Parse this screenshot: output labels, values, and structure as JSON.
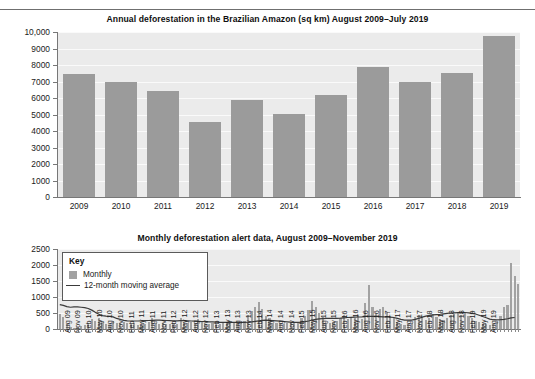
{
  "page": {
    "background": "#ffffff",
    "bar_color": "#9b9b9b",
    "plot_background": "#ebebeb",
    "line_color": "#3a3a3a"
  },
  "chart_data": [
    {
      "id": "annual",
      "type": "bar",
      "title": "Annual deforestation in the Brazilian Amazon (sq km) August 2009–July 2019",
      "xlabel": "",
      "ylabel": "",
      "ylim": [
        0,
        10000
      ],
      "ytick_labels": [
        "0",
        "1000",
        "2000",
        "3000",
        "4000",
        "5000",
        "6000",
        "7000",
        "8000",
        "9000",
        "10,000"
      ],
      "yticks": [
        0,
        1000,
        2000,
        3000,
        4000,
        5000,
        6000,
        7000,
        8000,
        9000,
        10000
      ],
      "grid": true,
      "legend": "none",
      "categories": [
        "2009",
        "2010",
        "2011",
        "2012",
        "2013",
        "2014",
        "2015",
        "2016",
        "2017",
        "2018",
        "2019"
      ],
      "values": [
        7460,
        7000,
        6420,
        4570,
        5890,
        5010,
        6210,
        7890,
        6950,
        7540,
        9760
      ]
    },
    {
      "id": "monthly",
      "type": "bar",
      "title": "Monthly deforestation alert data, August 2009–November 2019",
      "xlabel": "",
      "ylabel": "",
      "ylim": [
        0,
        2500
      ],
      "ytick_labels": [
        "0",
        "500",
        "1000",
        "1500",
        "2000",
        "2500"
      ],
      "yticks": [
        0,
        500,
        1000,
        1500,
        2000,
        2500
      ],
      "grid": true,
      "legend_position": "top-left",
      "legend": {
        "title": "Key",
        "entries": [
          {
            "label": "Monthly",
            "marker": "swatch",
            "color": "#a2a2a2"
          },
          {
            "label": "12-month moving average",
            "marker": "line",
            "color": "#3a3a3a"
          }
        ]
      },
      "xtick_labels": [
        "Aug 09",
        "Nov 09",
        "Feb 10",
        "May 10",
        "Aug 10",
        "Nov 10",
        "Feb 11",
        "May 11",
        "Aug 11",
        "Nov 11",
        "Feb 12",
        "May 12",
        "Aug 12",
        "Nov 12",
        "Feb 13",
        "May 13",
        "Aug 13",
        "Nov 13",
        "Feb 14",
        "May 14",
        "Aug 14",
        "Nov 14",
        "Feb 15",
        "May 15",
        "Aug 15",
        "Nov 15",
        "Feb 16",
        "May 16",
        "Aug 16",
        "Nov 16",
        "Feb 17",
        "May 17",
        "Aug 17",
        "Nov 17",
        "Feb 18",
        "May 18",
        "Aug 18",
        "Nov 18",
        "Feb 19",
        "May 19",
        "Aug 19"
      ],
      "xtick_every": 3,
      "series": [
        {
          "name": "Monthly",
          "type": "bar",
          "values": [
            470,
            380,
            150,
            70,
            40,
            60,
            95,
            120,
            180,
            300,
            250,
            330,
            230,
            170,
            120,
            260,
            200,
            180,
            230,
            200,
            170,
            190,
            130,
            120,
            150,
            210,
            330,
            190,
            170,
            175,
            150,
            160,
            185,
            170,
            330,
            190,
            180,
            230,
            200,
            320,
            210,
            170,
            150,
            180,
            150,
            160,
            200,
            210,
            230,
            180,
            170,
            200,
            260,
            430,
            560,
            690,
            840,
            620,
            420,
            330,
            200,
            185,
            175,
            165,
            180,
            210,
            180,
            200,
            330,
            420,
            580,
            870,
            700,
            500,
            390,
            200,
            180,
            210,
            250,
            330,
            440,
            300,
            340,
            350,
            430,
            300,
            820,
            1390,
            700,
            460,
            620,
            690,
            520,
            420,
            340,
            210,
            150,
            140,
            160,
            200,
            380,
            430,
            360,
            280,
            330,
            470,
            380,
            300,
            280,
            330,
            430,
            470,
            520,
            430,
            500,
            420,
            330,
            260,
            230,
            170,
            150,
            140,
            160,
            230,
            420,
            700,
            760,
            2050,
            1650,
            1400
          ]
        },
        {
          "name": "12-month moving average",
          "type": "line",
          "values": [
            760,
            740,
            700,
            680,
            690,
            690,
            680,
            670,
            640,
            590,
            520,
            460,
            420,
            400,
            390,
            380,
            330,
            300,
            270,
            255,
            250,
            250,
            250,
            255,
            260,
            265,
            270,
            275,
            275,
            270,
            265,
            260,
            255,
            255,
            260,
            260,
            255,
            250,
            245,
            240,
            235,
            230,
            225,
            220,
            215,
            210,
            210,
            208,
            205,
            205,
            205,
            205,
            210,
            215,
            225,
            240,
            255,
            270,
            275,
            270,
            262,
            255,
            245,
            235,
            225,
            215,
            210,
            210,
            215,
            230,
            250,
            280,
            300,
            315,
            325,
            330,
            330,
            330,
            335,
            340,
            350,
            360,
            365,
            370,
            375,
            380,
            390,
            395,
            395,
            390,
            385,
            380,
            375,
            370,
            360,
            330,
            300,
            280,
            275,
            280,
            300,
            330,
            370,
            400,
            425,
            440,
            450,
            460,
            475,
            490,
            500,
            505,
            510,
            515,
            515,
            505,
            490,
            470,
            430,
            390,
            350,
            310,
            290,
            285,
            290,
            300,
            320,
            345,
            360
          ]
        }
      ]
    }
  ]
}
